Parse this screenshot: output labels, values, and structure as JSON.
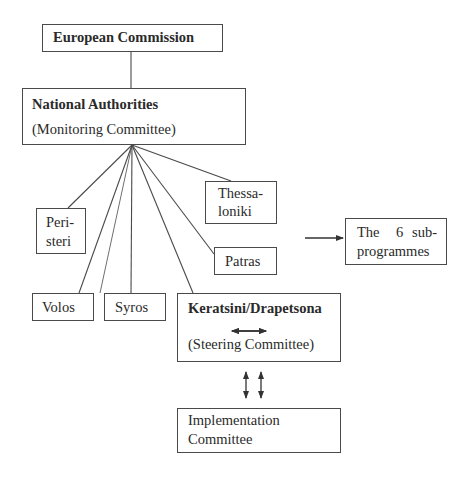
{
  "diagram": {
    "type": "organizational-hierarchy",
    "nodes": {
      "european_commission": {
        "label": "European Commission"
      },
      "national_authorities": {
        "title": "National Authorities",
        "subtitle": "(Monitoring Committee)"
      },
      "peristeri": {
        "line1": "Peri-",
        "line2": "steri"
      },
      "volos": {
        "label": "Volos"
      },
      "syros": {
        "label": "Syros"
      },
      "keratsini": {
        "title": "Keratsini/Drapetsona",
        "subtitle": "(Steering Committee)"
      },
      "patras": {
        "label": "Patras"
      },
      "thessaloniki": {
        "line1": "Thessa-",
        "line2": "loniki"
      },
      "subprogrammes": {
        "line1a": "The",
        "line1b": "6",
        "line1c": "sub-",
        "line2": "programmes"
      },
      "implementation": {
        "line1": "Implementation",
        "line2": "Committee"
      }
    },
    "edges": [
      {
        "from": "European Commission",
        "to": "National Authorities",
        "type": "line"
      },
      {
        "from": "National Authorities",
        "to": "Peristeri",
        "type": "line"
      },
      {
        "from": "National Authorities",
        "to": "Volos",
        "type": "line"
      },
      {
        "from": "National Authorities",
        "to": "Syros",
        "type": "line"
      },
      {
        "from": "National Authorities",
        "to": "Keratsini/Drapetsona",
        "type": "line"
      },
      {
        "from": "National Authorities",
        "to": "Patras",
        "type": "line"
      },
      {
        "from": "National Authorities",
        "to": "Thessaloniki",
        "type": "line"
      },
      {
        "from": "cities",
        "to": "The 6 sub-programmes",
        "type": "arrow"
      },
      {
        "from": "Keratsini/Drapetsona",
        "to": "Implementation Committee",
        "type": "double-bidirectional-arrow"
      }
    ]
  }
}
